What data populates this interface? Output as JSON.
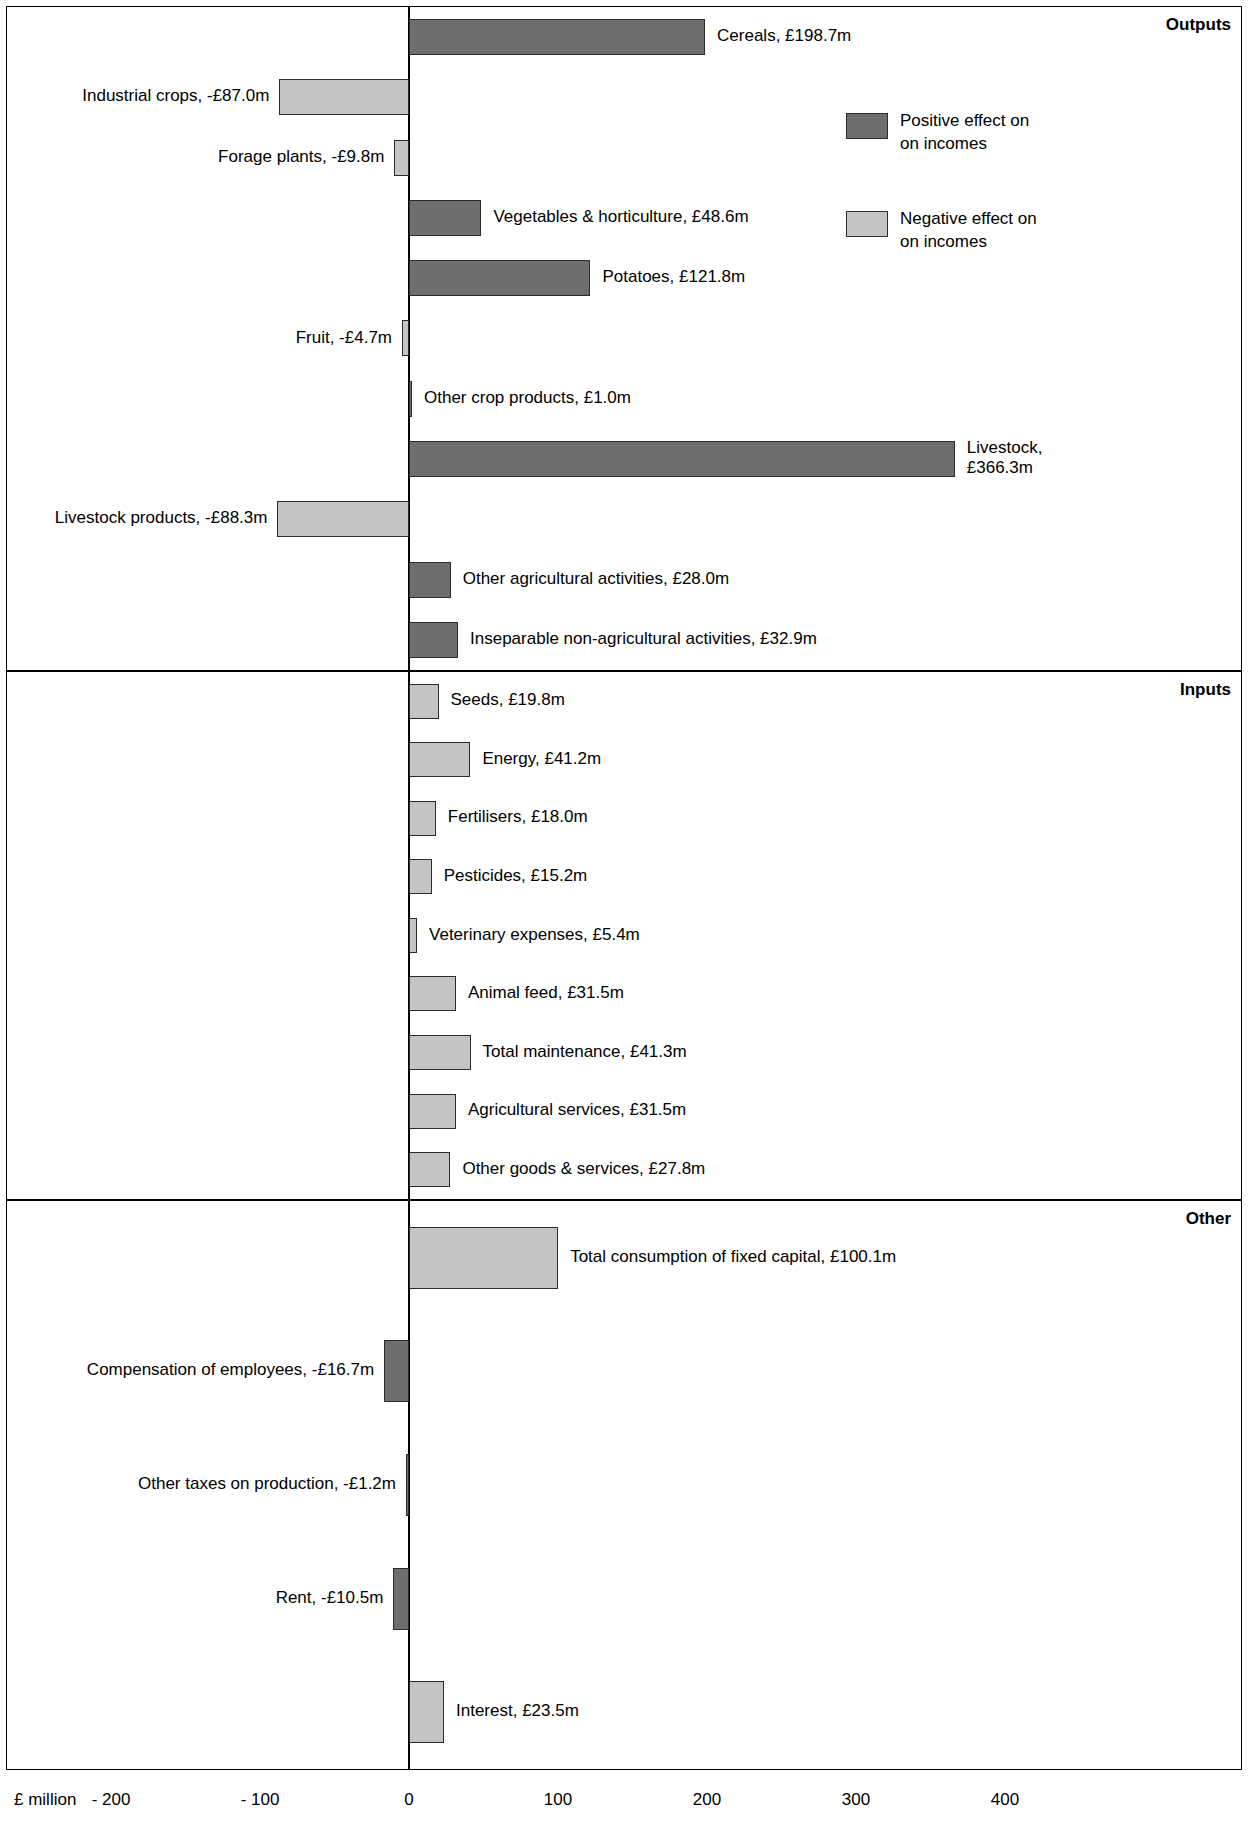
{
  "chart_data": {
    "type": "bar",
    "orientation": "horizontal",
    "title": "",
    "xlabel": "£ million",
    "ylabel": "",
    "xlim": [
      -250,
      430
    ],
    "xticks": [
      -200,
      -100,
      0,
      100,
      200,
      300,
      400
    ],
    "xtick_labels": [
      "- 200",
      "- 100",
      "0",
      "100",
      "200",
      "300",
      "400"
    ],
    "grid": false,
    "legend": {
      "position": "top-right",
      "entries": [
        {
          "label": "Positive effect on\non incomes",
          "line1": "Positive effect on",
          "line2": "on incomes",
          "color": "#6e6e6e"
        },
        {
          "label": "Negative effect on\non incomes",
          "line1": "Negative effect on",
          "line2": "on incomes",
          "color": "#c4c4c4"
        }
      ]
    },
    "panels": [
      {
        "name": "Outputs",
        "items": [
          {
            "category": "Cereals",
            "value": 198.7,
            "label": "Cereals, £198.7m",
            "shade": "dark"
          },
          {
            "category": "Industrial crops",
            "value": -87.0,
            "label": "Industrial crops, -£87.0m",
            "shade": "light"
          },
          {
            "category": "Forage plants",
            "value": -9.8,
            "label": "Forage plants, -£9.8m",
            "shade": "light"
          },
          {
            "category": "Vegetables & horticulture",
            "value": 48.6,
            "label": "Vegetables & horticulture, £48.6m",
            "shade": "dark"
          },
          {
            "category": "Potatoes",
            "value": 121.8,
            "label": "Potatoes, £121.8m",
            "shade": "dark"
          },
          {
            "category": "Fruit",
            "value": -4.7,
            "label": "Fruit, -£4.7m",
            "shade": "light"
          },
          {
            "category": "Other crop products",
            "value": 1.0,
            "label": "Other crop products, £1.0m",
            "shade": "dark"
          },
          {
            "category": "Livestock",
            "value": 366.3,
            "label": "Livestock,\n£366.3m",
            "shade": "dark"
          },
          {
            "category": "Livestock products",
            "value": -88.3,
            "label": "Livestock products, -£88.3m",
            "shade": "light"
          },
          {
            "category": "Other agricultural activities",
            "value": 28.0,
            "label": "Other agricultural activities, £28.0m",
            "shade": "dark"
          },
          {
            "category": "Inseparable non-agricultural activities",
            "value": 32.9,
            "label": "Inseparable non-agricultural activities, £32.9m",
            "shade": "dark"
          }
        ]
      },
      {
        "name": "Inputs",
        "items": [
          {
            "category": "Seeds",
            "value": 19.8,
            "label": "Seeds, £19.8m",
            "shade": "light"
          },
          {
            "category": "Energy",
            "value": 41.2,
            "label": "Energy, £41.2m",
            "shade": "light"
          },
          {
            "category": "Fertilisers",
            "value": 18.0,
            "label": "Fertilisers, £18.0m",
            "shade": "light"
          },
          {
            "category": "Pesticides",
            "value": 15.2,
            "label": "Pesticides, £15.2m",
            "shade": "light"
          },
          {
            "category": "Veterinary expenses",
            "value": 5.4,
            "label": "Veterinary expenses, £5.4m",
            "shade": "light"
          },
          {
            "category": "Animal feed",
            "value": 31.5,
            "label": "Animal feed, £31.5m",
            "shade": "light"
          },
          {
            "category": "Total maintenance",
            "value": 41.3,
            "label": "Total maintenance, £41.3m",
            "shade": "light"
          },
          {
            "category": "Agricultural services",
            "value": 31.5,
            "label": "Agricultural services, £31.5m",
            "shade": "light"
          },
          {
            "category": "Other goods & services",
            "value": 27.8,
            "label": "Other goods & services, £27.8m",
            "shade": "light"
          }
        ]
      },
      {
        "name": "Other",
        "items": [
          {
            "category": "Total consumption of fixed capital",
            "value": 100.1,
            "label": "Total consumption of fixed capital, £100.1m",
            "shade": "light"
          },
          {
            "category": "Compensation of employees",
            "value": -16.7,
            "label": "Compensation of employees, -£16.7m",
            "shade": "dark"
          },
          {
            "category": "Other taxes on production",
            "value": -1.2,
            "label": "Other taxes on production, -£1.2m",
            "shade": "dark"
          },
          {
            "category": "Rent",
            "value": -10.5,
            "label": "Rent, -£10.5m",
            "shade": "dark"
          },
          {
            "category": "Interest",
            "value": 23.5,
            "label": "Interest, £23.5m",
            "shade": "light"
          }
        ]
      }
    ]
  },
  "axis": {
    "unit_label": "£ million"
  },
  "panel_titles": {
    "outputs": "Outputs",
    "inputs": "Inputs",
    "other": "Other"
  }
}
